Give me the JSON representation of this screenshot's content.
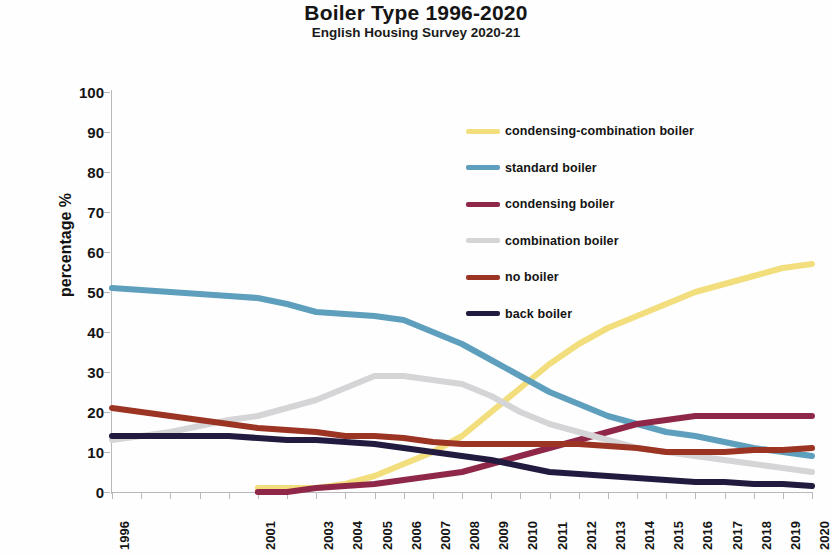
{
  "chart_data": {
    "type": "line",
    "title": "Boiler Type 1996-2020",
    "subtitle": "English Housing Survey 2020-21",
    "xlabel": "",
    "ylabel": "percentage %",
    "ylim": [
      0,
      100
    ],
    "ytick_step": 10,
    "yticks": [
      "0",
      "10",
      "20",
      "30",
      "40",
      "50",
      "60",
      "70",
      "80",
      "90",
      "100"
    ],
    "grid": false,
    "legend_position": "inside-top-right",
    "x": [
      1996,
      1997,
      1998,
      1999,
      2000,
      2001,
      2002,
      2003,
      2004,
      2005,
      2006,
      2007,
      2008,
      2009,
      2010,
      2011,
      2012,
      2013,
      2014,
      2015,
      2016,
      2017,
      2018,
      2019,
      2020
    ],
    "tick_labels": [
      "1996",
      "",
      "",
      "",
      "",
      "2001",
      "",
      "2003",
      "2004",
      "2005",
      "2006",
      "2007",
      "2008",
      "2009",
      "2010",
      "2011",
      "2012",
      "2013",
      "2014",
      "2015",
      "2016",
      "2017",
      "2018",
      "2019",
      "2020"
    ],
    "series": [
      {
        "name": "condensing-combination boiler",
        "color": "#f2de7c",
        "starts_at": 2001,
        "values": [
          null,
          null,
          null,
          null,
          null,
          1,
          1,
          1,
          2,
          4,
          7,
          10,
          14,
          20,
          26,
          32,
          37,
          41,
          44,
          47,
          50,
          52,
          54,
          56,
          57
        ]
      },
      {
        "name": "standard boiler",
        "color": "#5d9fbc",
        "starts_at": 1996,
        "values": [
          51,
          50.5,
          50,
          49.5,
          49,
          48.5,
          47,
          45,
          44.5,
          44,
          43,
          40,
          37,
          33,
          29,
          25,
          22,
          19,
          17,
          15,
          14,
          12.5,
          11,
          10,
          9
        ]
      },
      {
        "name": "condensing boiler",
        "color": "#8f2748",
        "starts_at": 2001,
        "values": [
          null,
          null,
          null,
          null,
          null,
          0,
          0,
          1,
          1.5,
          2,
          3,
          4,
          5,
          7,
          9,
          11,
          13,
          15,
          17,
          18,
          19,
          19,
          19,
          19,
          19
        ]
      },
      {
        "name": "combination boiler",
        "color": "#d5d5d7",
        "starts_at": 1996,
        "values": [
          13,
          14,
          15,
          16.5,
          18,
          19,
          21,
          23,
          26,
          29,
          29,
          28,
          27,
          24,
          20,
          17,
          15,
          13,
          11,
          10,
          9,
          8,
          7,
          6,
          5
        ]
      },
      {
        "name": "no boiler",
        "color": "#9c3424",
        "starts_at": 1996,
        "values": [
          21,
          20,
          19,
          18,
          17,
          16,
          15.5,
          15,
          14,
          14,
          13.5,
          12.5,
          12,
          12,
          12,
          12,
          12,
          11.5,
          11,
          10,
          10,
          10,
          10.5,
          10.5,
          11
        ]
      },
      {
        "name": "back boiler",
        "color": "#231a40",
        "starts_at": 1996,
        "values": [
          14,
          14,
          14,
          14,
          14,
          13.5,
          13,
          13,
          12.5,
          12,
          11,
          10,
          9,
          8,
          6.5,
          5,
          4.5,
          4,
          3.5,
          3,
          2.5,
          2.5,
          2,
          2,
          1.5
        ]
      }
    ]
  }
}
